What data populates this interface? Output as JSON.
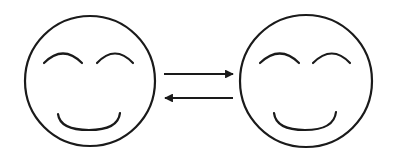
{
  "diagram": {
    "stroke_color": "#1a1a1a",
    "background": "#ffffff",
    "nodes": [
      {
        "id": "left-face",
        "type": "smiley-face"
      },
      {
        "id": "right-face",
        "type": "smiley-face"
      }
    ],
    "edges": [
      {
        "from": "left-face",
        "to": "right-face",
        "direction": "right"
      },
      {
        "from": "right-face",
        "to": "left-face",
        "direction": "left"
      }
    ]
  }
}
